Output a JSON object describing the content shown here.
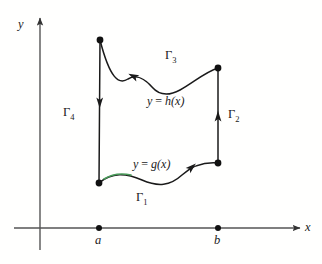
{
  "figure": {
    "background_color": "#fffffe",
    "ink_color": "#1a1a1a",
    "axis_color": "#555555",
    "highlight_color": "#4a9c5a"
  },
  "axes": {
    "y_label": "y",
    "x_label": "x",
    "origin": {
      "x": 40,
      "y": 228
    },
    "x_axis": {
      "x1": 14,
      "y1": 228,
      "x2": 300,
      "y2": 228,
      "arrow": "right"
    },
    "y_axis": {
      "x1": 40,
      "y1": 250,
      "x2": 40,
      "y2": 18,
      "arrow": "up"
    }
  },
  "ticks": [
    {
      "label": "a",
      "x": 99,
      "y": 228,
      "label_x": 95,
      "label_y": 234
    },
    {
      "label": "b",
      "x": 218,
      "y": 228,
      "label_x": 214,
      "label_y": 234
    }
  ],
  "vertices": [
    {
      "name": "top-left",
      "x": 100,
      "y": 40
    },
    {
      "name": "top-right",
      "x": 218,
      "y": 68
    },
    {
      "name": "bottom-right",
      "x": 218,
      "y": 163
    },
    {
      "name": "bottom-left",
      "x": 99,
      "y": 183
    }
  ],
  "curves": {
    "gamma1": {
      "label": "Γ",
      "subscript": "1",
      "function_label_lhs": "y",
      "function_label_eq": " = ",
      "function_label_rhs": "g(x)",
      "orientation": "left-to-right",
      "path": "M 99 183 C 112 172, 126 173, 142 180 C 158 187, 170 186, 182 175 C 194 164, 206 162, 218 163",
      "highlight_path": "M 104 179 C 112 174, 122 173, 131 175",
      "arrow_at": {
        "x": 192,
        "y": 167,
        "angle": -42
      },
      "label_position": {
        "x": 136,
        "y": 191
      },
      "function_label_position": {
        "x": 133,
        "y": 158
      }
    },
    "gamma2": {
      "label": "Γ",
      "subscript": "2",
      "orientation": "upward",
      "path": "M 218 163 L 218 68",
      "arrow_at": {
        "x": 218,
        "y": 116,
        "angle": -90
      },
      "label_position": {
        "x": 228,
        "y": 108
      }
    },
    "gamma3": {
      "label": "Γ",
      "subscript": "3",
      "function_label_lhs": "y",
      "function_label_eq": " = ",
      "function_label_rhs": "h(x)",
      "orientation": "right-to-left",
      "path": "M 218 68 C 205 72, 193 83, 180 90 C 167 97, 158 94, 152 87 C 145 79, 136 74, 128 79 C 119 85, 110 79, 100 40",
      "arrow_at": {
        "x": 133,
        "y": 76,
        "angle": 206
      },
      "label_position": {
        "x": 165,
        "y": 49
      },
      "function_label_position": {
        "x": 147,
        "y": 95
      }
    },
    "gamma4": {
      "label": "Γ",
      "subscript": "4",
      "orientation": "downward",
      "path": "M 100 40 L 99 183",
      "arrow_at": {
        "x": 99.7,
        "y": 103,
        "angle": 90
      },
      "label_position": {
        "x": 63,
        "y": 106
      }
    }
  }
}
